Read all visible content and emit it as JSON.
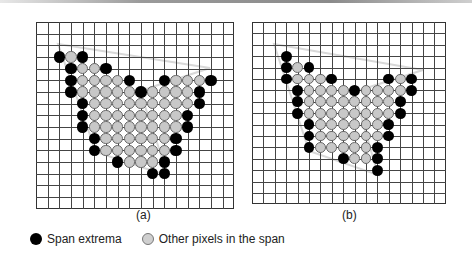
{
  "figure": {
    "panels": [
      {
        "id": "a",
        "label": "(a)",
        "grid": {
          "left": 36,
          "top": 22,
          "step": 11.67,
          "cols": 17,
          "rows": 16
        },
        "circle_row_offset": 3,
        "label_pos": {
          "x": 134,
          "y": 208
        },
        "polygon": [
          [
            58,
            44
          ],
          [
            210,
            68
          ],
          [
            140,
            91
          ],
          [
            168,
            176
          ],
          [
            96,
            152
          ]
        ],
        "rows": [
          {
            "r": 0,
            "black": [
              2,
              4
            ],
            "gray": [
              3
            ]
          },
          {
            "r": 1,
            "black": [
              3,
              6
            ],
            "gray": [
              4,
              5
            ]
          },
          {
            "r": 2,
            "black": [
              3,
              8,
              11,
              15
            ],
            "gray": [
              4,
              5,
              6,
              7,
              12,
              13,
              14
            ]
          },
          {
            "r": 3,
            "black": [
              3,
              9,
              14
            ],
            "gray": [
              4,
              5,
              6,
              7,
              8,
              10,
              11,
              12,
              13
            ]
          },
          {
            "r": 4,
            "black": [
              4,
              14
            ],
            "gray": [
              5,
              6,
              7,
              8,
              9,
              10,
              11,
              12,
              13
            ]
          },
          {
            "r": 5,
            "black": [
              4,
              13
            ],
            "gray": [
              5,
              6,
              7,
              8,
              9,
              10,
              11,
              12
            ]
          },
          {
            "r": 6,
            "black": [
              4,
              13
            ],
            "gray": [
              5,
              6,
              7,
              8,
              9,
              10,
              11,
              12
            ]
          },
          {
            "r": 7,
            "black": [
              5,
              12
            ],
            "gray": [
              6,
              7,
              8,
              9,
              10,
              11
            ]
          },
          {
            "r": 8,
            "black": [
              5,
              12
            ],
            "gray": [
              6,
              7,
              8,
              9,
              10,
              11
            ]
          },
          {
            "r": 9,
            "black": [
              7,
              11
            ],
            "gray": [
              8,
              9,
              10
            ]
          },
          {
            "r": 10,
            "black": [
              10,
              11
            ],
            "gray": []
          }
        ]
      },
      {
        "id": "b",
        "label": "(b)",
        "grid": {
          "left": 252,
          "top": 22,
          "step": 11.4,
          "cols": 17,
          "rows": 16
        },
        "circle_row_offset": 3,
        "label_pos": {
          "x": 342,
          "y": 208
        },
        "polygon": [
          [
            274,
            44
          ],
          [
            423,
            70
          ],
          [
            354,
            92
          ],
          [
            378,
            175
          ],
          [
            309,
            151
          ]
        ],
        "rows": [
          {
            "r": 0,
            "black": [
              3
            ],
            "gray": []
          },
          {
            "r": 1,
            "black": [
              3,
              5
            ],
            "gray": [
              4
            ]
          },
          {
            "r": 2,
            "black": [
              3,
              7,
              12,
              14
            ],
            "gray": [
              4,
              5,
              6,
              13
            ]
          },
          {
            "r": 3,
            "black": [
              4,
              9,
              14
            ],
            "gray": [
              5,
              6,
              7,
              8,
              10,
              11,
              12,
              13
            ]
          },
          {
            "r": 4,
            "black": [
              4,
              13
            ],
            "gray": [
              5,
              6,
              7,
              8,
              9,
              10,
              11,
              12
            ]
          },
          {
            "r": 5,
            "black": [
              4,
              13
            ],
            "gray": [
              5,
              6,
              7,
              8,
              9,
              10,
              11,
              12
            ]
          },
          {
            "r": 6,
            "black": [
              5,
              12
            ],
            "gray": [
              6,
              7,
              8,
              9,
              10,
              11
            ]
          },
          {
            "r": 7,
            "black": [
              5,
              12
            ],
            "gray": [
              6,
              7,
              8,
              9,
              10,
              11
            ]
          },
          {
            "r": 8,
            "black": [
              5,
              11
            ],
            "gray": [
              6,
              7,
              8,
              9,
              10
            ]
          },
          {
            "r": 9,
            "black": [
              8,
              11
            ],
            "gray": [
              9,
              10
            ]
          },
          {
            "r": 10,
            "black": [
              11
            ],
            "gray": []
          }
        ]
      }
    ],
    "legend": {
      "extrema_label": "Span extrema",
      "other_label": "Other pixels in the span"
    },
    "colors": {
      "extrema": "#000000",
      "other": "#c8c8c8",
      "polygon_stroke": "#d8d8d8",
      "grid": "#444444"
    }
  }
}
